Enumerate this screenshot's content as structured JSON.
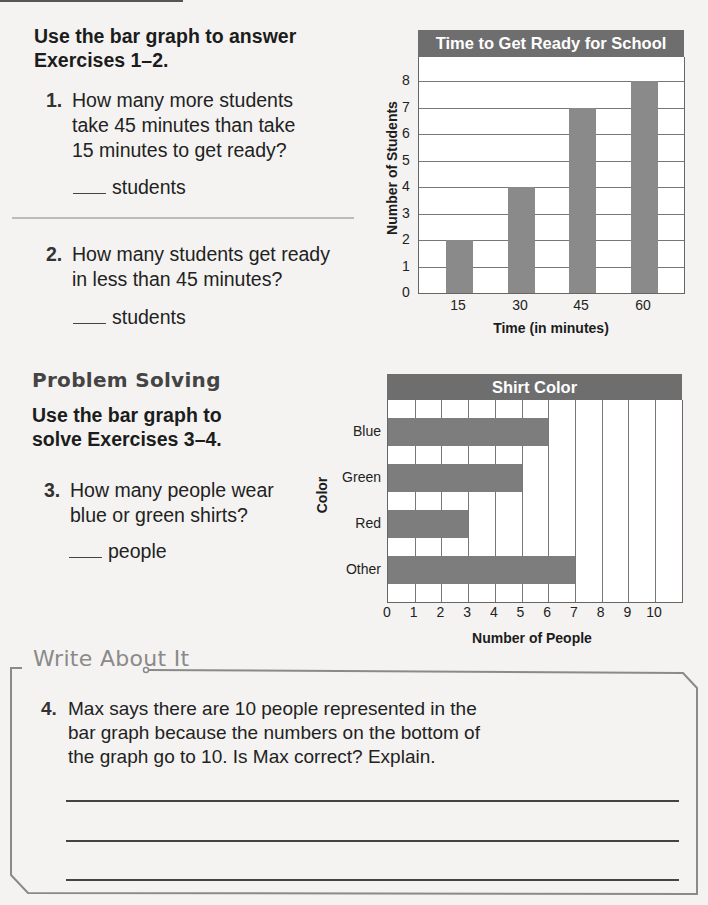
{
  "section1": {
    "instructions": [
      "Use the bar graph to answer",
      "Exercises 1–2."
    ],
    "questions": [
      {
        "number": "1.",
        "lines": [
          "How many more students",
          "take 45 minutes than take",
          "15 minutes to get ready?"
        ],
        "answer_unit": "students",
        "answer_value": ""
      },
      {
        "number": "2.",
        "lines": [
          "How many students get ready",
          "in less than 45 minutes?"
        ],
        "answer_unit": "students",
        "answer_value": ""
      }
    ]
  },
  "problem_solving": {
    "title": "Problem Solving",
    "instructions": [
      "Use the bar graph to",
      "solve Exercises 3–4."
    ],
    "questions": [
      {
        "number": "3.",
        "lines": [
          "How many people wear",
          "blue or green shirts?"
        ],
        "answer_unit": "people",
        "answer_value": ""
      }
    ]
  },
  "write_about_it": {
    "title": "Write About It",
    "question": {
      "number": "4.",
      "lines": [
        "Max says there are 10 people represented in the",
        "bar graph because the numbers on the bottom of",
        "the graph go to 10. Is Max correct? Explain."
      ]
    },
    "answer_lines": 3
  },
  "chart_data": [
    {
      "type": "bar",
      "orientation": "vertical",
      "title": "Time to Get Ready for School",
      "xlabel": "Time (in minutes)",
      "ylabel": "Number of Students",
      "categories": [
        "15",
        "30",
        "45",
        "60"
      ],
      "values": [
        2,
        4,
        7,
        8
      ],
      "yticks": [
        "0",
        "1",
        "2",
        "3",
        "4",
        "5",
        "6",
        "7",
        "8"
      ],
      "ylim": [
        0,
        8
      ],
      "grid": "horizontal",
      "bar_color": "#8a8a8a",
      "header_color": "#6e6e6e"
    },
    {
      "type": "bar",
      "orientation": "horizontal",
      "title": "Shirt Color",
      "xlabel": "Number of People",
      "ylabel": "Color",
      "categories": [
        "Blue",
        "Green",
        "Red",
        "Other"
      ],
      "values": [
        6,
        5,
        3,
        7
      ],
      "xticks": [
        "0",
        "1",
        "2",
        "3",
        "4",
        "5",
        "6",
        "7",
        "8",
        "9",
        "10"
      ],
      "xlim": [
        0,
        11
      ],
      "grid": "vertical",
      "bar_color": "#8a8a8a",
      "header_color": "#6e6e6e"
    }
  ]
}
